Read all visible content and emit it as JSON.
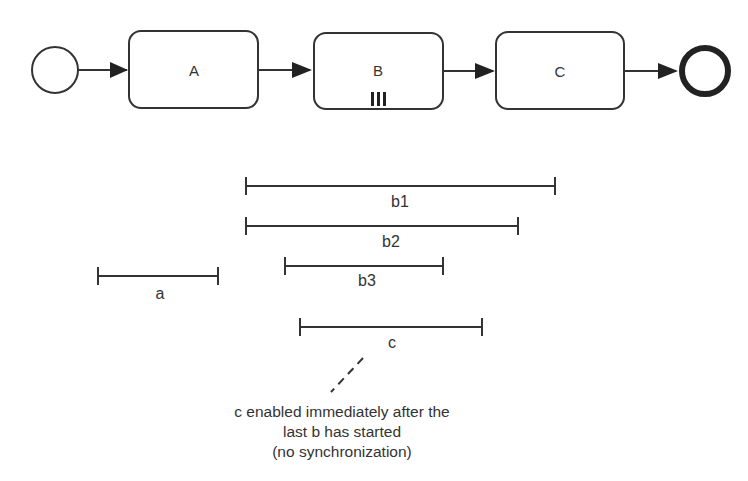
{
  "process": {
    "start_event": {
      "type": "start"
    },
    "tasks": [
      {
        "label": "A",
        "marker": ""
      },
      {
        "label": "B",
        "marker": "parallel-multi-instance"
      },
      {
        "label": "C",
        "marker": ""
      }
    ],
    "end_event": {
      "type": "end"
    }
  },
  "timeline": {
    "bars": [
      {
        "label": "a",
        "x1": 98,
        "x2": 218,
        "y": 276
      },
      {
        "label": "b1",
        "x1": 246,
        "x2": 555,
        "y": 186
      },
      {
        "label": "b2",
        "x1": 246,
        "x2": 518,
        "y": 226
      },
      {
        "label": "b3",
        "x1": 285,
        "x2": 443,
        "y": 266
      },
      {
        "label": "c",
        "x1": 300,
        "x2": 482,
        "y": 327
      }
    ]
  },
  "annotation": {
    "lines": [
      "c enabled immediately after the",
      "last b has started",
      "(no synchronization)"
    ]
  }
}
